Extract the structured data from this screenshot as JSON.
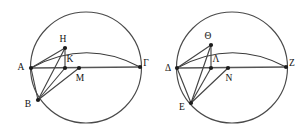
{
  "figure": {
    "canvas": {
      "width": 302,
      "height": 132
    },
    "stroke_color": "#454545",
    "label_color": "#111111",
    "background": "#ffffff"
  },
  "diagrams": [
    {
      "id": "left-diagram",
      "name": "left-circle-diagram",
      "circle": {
        "cx": 86,
        "cy": 67.5,
        "r": 55.5
      },
      "arc": {
        "start_x": 31,
        "start_y": 68,
        "end_x": 140,
        "end_y": 67,
        "ctrl_x": 86,
        "ctrl_y": 38
      },
      "points": [
        {
          "key": "A",
          "label": "A",
          "x": 31,
          "y": 68,
          "lx": 21,
          "ly": 68,
          "dot": true
        },
        {
          "key": "B",
          "label": "B",
          "x": 38,
          "y": 100,
          "lx": 28,
          "ly": 105,
          "dot": true
        },
        {
          "key": "G",
          "label": "Γ",
          "x": 140,
          "y": 67,
          "lx": 146,
          "ly": 64,
          "dot": true
        },
        {
          "key": "H",
          "label": "H",
          "x": 65,
          "y": 48,
          "lx": 63,
          "ly": 40,
          "dot": true
        },
        {
          "key": "K",
          "label": "K",
          "x": 65,
          "y": 68,
          "lx": 70,
          "ly": 60,
          "dot": true
        },
        {
          "key": "M",
          "label": "M",
          "x": 79,
          "y": 68,
          "lx": 80,
          "ly": 79,
          "dot": true
        }
      ],
      "segments": [
        {
          "from": "A",
          "to": "G",
          "kind": "diameter"
        },
        {
          "from": "A",
          "to": "H",
          "kind": "chord"
        },
        {
          "from": "H",
          "to": "K",
          "kind": "chord"
        },
        {
          "from": "B",
          "to": "H",
          "kind": "chord"
        },
        {
          "from": "B",
          "to": "K",
          "kind": "chord"
        },
        {
          "from": "B",
          "to": "A",
          "kind": "chord"
        },
        {
          "from": "B",
          "to": "M",
          "kind": "chord"
        }
      ]
    },
    {
      "id": "right-diagram",
      "name": "right-circle-diagram",
      "circle": {
        "cx": 232,
        "cy": 67.5,
        "r": 55.5
      },
      "arc": {
        "start_x": 177,
        "start_y": 68,
        "end_x": 286,
        "end_y": 67,
        "ctrl_x": 232,
        "ctrl_y": 38
      },
      "points": [
        {
          "key": "D",
          "label": "Δ",
          "x": 177,
          "y": 68,
          "lx": 168,
          "ly": 69,
          "dot": true
        },
        {
          "key": "E",
          "label": "E",
          "x": 191,
          "y": 103,
          "lx": 182,
          "ly": 108,
          "dot": true
        },
        {
          "key": "Z",
          "label": "Z",
          "x": 286,
          "y": 67,
          "lx": 292,
          "ly": 64,
          "dot": true
        },
        {
          "key": "Th",
          "label": "Θ",
          "x": 211,
          "y": 45,
          "lx": 208,
          "ly": 37,
          "dot": true
        },
        {
          "key": "L",
          "label": "Λ",
          "x": 211,
          "y": 68,
          "lx": 216,
          "ly": 60,
          "dot": true
        },
        {
          "key": "N",
          "label": "N",
          "x": 228,
          "y": 68,
          "lx": 229,
          "ly": 79,
          "dot": true
        }
      ],
      "segments": [
        {
          "from": "D",
          "to": "Z",
          "kind": "diameter"
        },
        {
          "from": "D",
          "to": "Th",
          "kind": "chord"
        },
        {
          "from": "Th",
          "to": "L",
          "kind": "chord"
        },
        {
          "from": "E",
          "to": "Th",
          "kind": "chord"
        },
        {
          "from": "E",
          "to": "L",
          "kind": "chord"
        },
        {
          "from": "E",
          "to": "D",
          "kind": "chord"
        },
        {
          "from": "E",
          "to": "N",
          "kind": "chord"
        }
      ]
    }
  ]
}
